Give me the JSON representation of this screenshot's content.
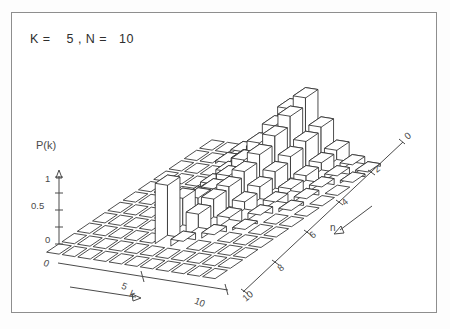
{
  "figure": {
    "title": "K =    5 , N =   10",
    "frame_color": "#8e8e8e",
    "ink_color": "#2e2e2e"
  },
  "axes": {
    "vertical": {
      "label": "P(k)",
      "ticks": [
        "0",
        "0.5",
        "1"
      ],
      "range": [
        0,
        1
      ]
    },
    "left_horizontal": {
      "label": "k",
      "ticks": [
        "0",
        "5",
        "10"
      ],
      "range": [
        0,
        10
      ]
    },
    "right_depth": {
      "label": "n",
      "ticks": [
        "0",
        "2",
        "4",
        "6",
        "8",
        "10"
      ],
      "range": [
        0,
        10
      ]
    }
  },
  "chart_data": {
    "type": "bar",
    "title": "K =    5 , N =   10",
    "xlabel": "k",
    "ylabel": "P(k)",
    "zlabel": "n",
    "grid": false,
    "legend": null,
    "projection": "3d-isometric",
    "x": [
      0,
      1,
      2,
      3,
      4,
      5,
      6,
      7,
      8,
      9,
      10
    ],
    "z": [
      0,
      1,
      2,
      3,
      4,
      5,
      6,
      7,
      8,
      9,
      10
    ],
    "xlim": [
      0,
      10
    ],
    "zlim": [
      0,
      10
    ],
    "ylim": [
      0,
      1
    ],
    "series": [
      {
        "name": "n=0",
        "values": [
          0.0,
          0.0,
          0.0,
          0.0,
          0.0,
          0.0,
          0.0,
          0.0,
          0.0,
          0.0,
          0.0
        ]
      },
      {
        "name": "n=1",
        "values": [
          0.0,
          0.0,
          0.0,
          0.0,
          0.0,
          0.0,
          0.0,
          0.0,
          0.0,
          0.0,
          0.0
        ]
      },
      {
        "name": "n=2",
        "values": [
          0.0,
          0.0,
          0.0,
          0.0,
          0.0,
          0.9,
          0.1,
          0.0,
          0.0,
          0.0,
          0.0
        ]
      },
      {
        "name": "n=3",
        "values": [
          0.0,
          0.0,
          0.0,
          0.0,
          0.0,
          0.55,
          0.35,
          0.08,
          0.0,
          0.0,
          0.0
        ]
      },
      {
        "name": "n=4",
        "values": [
          0.0,
          0.0,
          0.0,
          0.0,
          0.05,
          0.4,
          0.42,
          0.18,
          0.04,
          0.0,
          0.0
        ]
      },
      {
        "name": "n=5",
        "values": [
          0.0,
          0.0,
          0.0,
          0.02,
          0.1,
          0.38,
          0.45,
          0.26,
          0.1,
          0.03,
          0.0
        ]
      },
      {
        "name": "n=6",
        "values": [
          0.0,
          0.0,
          0.0,
          0.04,
          0.16,
          0.42,
          0.52,
          0.33,
          0.14,
          0.05,
          0.02
        ]
      },
      {
        "name": "n=7",
        "values": [
          0.0,
          0.0,
          0.02,
          0.07,
          0.22,
          0.5,
          0.62,
          0.4,
          0.18,
          0.07,
          0.03
        ]
      },
      {
        "name": "n=8",
        "values": [
          0.0,
          0.0,
          0.03,
          0.1,
          0.28,
          0.6,
          0.74,
          0.47,
          0.22,
          0.09,
          0.03
        ]
      },
      {
        "name": "n=9",
        "values": [
          0.0,
          0.0,
          0.04,
          0.12,
          0.33,
          0.7,
          0.88,
          0.54,
          0.26,
          0.1,
          0.04
        ]
      },
      {
        "name": "n=10",
        "values": [
          0.0,
          0.0,
          0.05,
          0.14,
          0.38,
          0.8,
          1.0,
          0.6,
          0.29,
          0.11,
          0.04
        ]
      }
    ]
  }
}
